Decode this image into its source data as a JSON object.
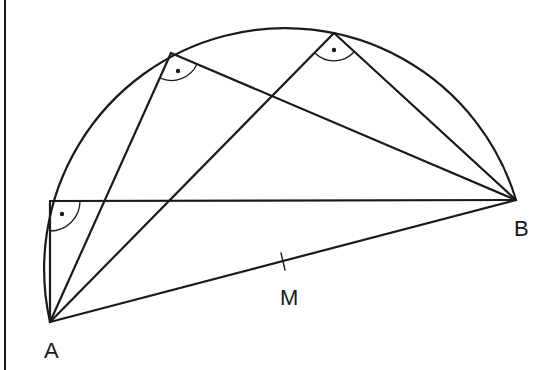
{
  "diagram": {
    "type": "thales-semicircle",
    "colors": {
      "line": "#1a1a1a",
      "background": "#ffffff"
    },
    "points": {
      "A": {
        "label": "A",
        "x": 50,
        "y": 322,
        "label_x": 44,
        "label_y": 358
      },
      "B": {
        "label": "B",
        "x": 516,
        "y": 200,
        "label_x": 514,
        "label_y": 236
      },
      "M": {
        "label": "M",
        "x": 283,
        "y": 261,
        "label_x": 280,
        "label_y": 305
      },
      "P1": {
        "x": 171,
        "y": 53
      },
      "P2": {
        "x": 334,
        "y": 33
      },
      "P3": {
        "x": 50,
        "y": 201
      }
    },
    "right_angle_markers": [
      {
        "vertex": "P1",
        "symbol": "right-angle-dot"
      },
      {
        "vertex": "P2",
        "symbol": "right-angle-dot"
      },
      {
        "vertex": "P3",
        "symbol": "right-angle-dot"
      }
    ],
    "labels": {
      "A": "A",
      "B": "B",
      "M": "M"
    }
  }
}
